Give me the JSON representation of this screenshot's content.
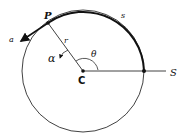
{
  "diagram": {
    "labels": {
      "P": "P",
      "s": "s",
      "r": "r",
      "theta": "θ",
      "alpha": "α",
      "a": "a",
      "C": "C",
      "S": "S"
    },
    "colors": {
      "stroke": "#111111",
      "background": "#ffffff"
    }
  }
}
